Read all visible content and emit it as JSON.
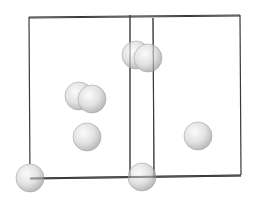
{
  "diagram": {
    "type": "crystal-unit-cell",
    "background": "#ffffff",
    "edge_color": "#3a3a3a",
    "atom_fill_light": "#fbfbfb",
    "atom_fill_mid": "#e2e2e2",
    "atom_fill_dark": "#b4b4b4",
    "atom_stroke": "#a6a6a6",
    "edges": [
      {
        "name": "back-top",
        "x1": 29,
        "y1": 17,
        "x2": 240,
        "y2": 15
      },
      {
        "name": "front-top",
        "x1": 29,
        "y1": 18,
        "x2": 240,
        "y2": 16
      },
      {
        "name": "left-vertical",
        "x1": 29,
        "y1": 17,
        "x2": 30,
        "y2": 179
      },
      {
        "name": "inner-vertical-1",
        "x1": 130,
        "y1": 15,
        "x2": 130,
        "y2": 178
      },
      {
        "name": "inner-vertical-2",
        "x1": 153,
        "y1": 18,
        "x2": 154,
        "y2": 178
      },
      {
        "name": "right-vertical",
        "x1": 240,
        "y1": 15,
        "x2": 241,
        "y2": 175
      },
      {
        "name": "bottom-back",
        "x1": 30,
        "y1": 178,
        "x2": 241,
        "y2": 175
      },
      {
        "name": "bottom-front",
        "x1": 30,
        "y1": 179,
        "x2": 241,
        "y2": 176
      },
      {
        "name": "inner-bottom",
        "x1": 130,
        "y1": 178,
        "x2": 154,
        "y2": 178
      }
    ],
    "atoms": [
      {
        "name": "atom-top-back",
        "cx": 136,
        "cy": 55,
        "r": 14
      },
      {
        "name": "atom-top-front",
        "cx": 148,
        "cy": 58,
        "r": 14
      },
      {
        "name": "atom-mid-back",
        "cx": 79,
        "cy": 96,
        "r": 14
      },
      {
        "name": "atom-mid-front",
        "cx": 92,
        "cy": 99,
        "r": 14
      },
      {
        "name": "atom-center-left",
        "cx": 87,
        "cy": 137,
        "r": 14
      },
      {
        "name": "atom-center-right",
        "cx": 198,
        "cy": 136,
        "r": 14
      },
      {
        "name": "atom-corner-left",
        "cx": 30,
        "cy": 178,
        "r": 14
      },
      {
        "name": "atom-corner-mid",
        "cx": 142,
        "cy": 177,
        "r": 14
      }
    ]
  }
}
